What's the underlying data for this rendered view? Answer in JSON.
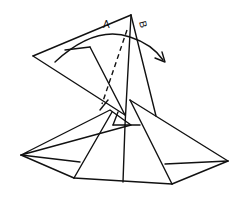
{
  "diagram": {
    "type": "origami folding step",
    "labels": {
      "a": "A",
      "b": "B"
    },
    "arrow": "rotate-flap-clockwise",
    "line_color": "#111111",
    "background": "#ffffff"
  }
}
